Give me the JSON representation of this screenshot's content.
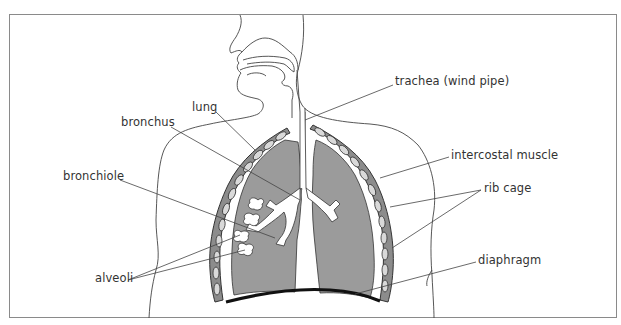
{
  "diagram": {
    "type": "anatomical-diagram",
    "labels": {
      "lung": "lung",
      "bronchus": "bronchus",
      "bronchiole": "bronchiole",
      "alveoli": "alveoli",
      "trachea": "trachea (wind pipe)",
      "intercostal_muscle": "intercostal muscle",
      "rib_cage": "rib cage",
      "diaphragm": "diaphragm"
    },
    "colors": {
      "lung_fill": "#9b9b9b",
      "rib_fill": "#8c8c8c",
      "rib_oval": "#d9d9d9",
      "outline": "#333333",
      "diaphragm": "#111111",
      "frame": "#8a8a8a",
      "airway": "#ffffff"
    }
  }
}
